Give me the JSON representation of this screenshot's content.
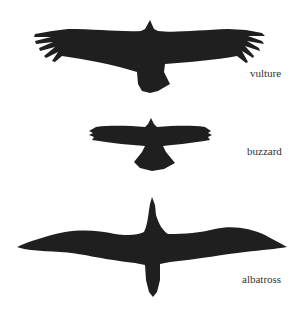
{
  "diagram": {
    "title": "",
    "birds": [
      {
        "id": "vulture",
        "label": "vulture"
      },
      {
        "id": "buzzard",
        "label": "buzzard"
      },
      {
        "id": "albatross",
        "label": "albatross"
      }
    ],
    "colors": {
      "silhouette": "#1f1f1f",
      "label": "#333333",
      "background": "#ffffff"
    }
  }
}
